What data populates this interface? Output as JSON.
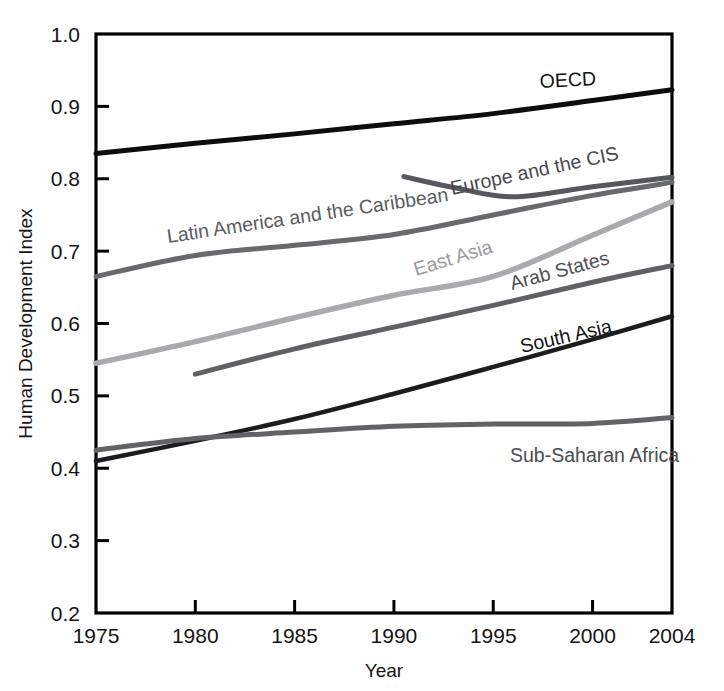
{
  "chart_data": {
    "type": "line",
    "title": "",
    "xlabel": "Year",
    "ylabel": "Human Development Index",
    "xlim": [
      1975,
      2004
    ],
    "ylim": [
      0.2,
      1.0
    ],
    "grid": false,
    "legend_position": "inline-labels",
    "xticks": [
      "1975",
      "1980",
      "1985",
      "1990",
      "1995",
      "2000",
      "2004"
    ],
    "xtick_values": [
      1975,
      1980,
      1985,
      1990,
      1995,
      2000,
      2004
    ],
    "yticks": [
      "0.2",
      "0.3",
      "0.4",
      "0.5",
      "0.6",
      "0.7",
      "0.8",
      "0.9",
      "1.0"
    ],
    "ytick_values": [
      0.2,
      0.3,
      0.4,
      0.5,
      0.6,
      0.7,
      0.8,
      0.9,
      1.0
    ],
    "series": [
      {
        "name": "OECD",
        "color": "#0d0d0d",
        "width": 5.0,
        "label": "OECD",
        "label_x": 540,
        "label_y": 88,
        "label_rotate": -3.0,
        "label_color": "#141414",
        "x": [
          1975,
          1980,
          1985,
          1990,
          1995,
          2000,
          2004
        ],
        "y": [
          0.835,
          0.849,
          0.862,
          0.876,
          0.89,
          0.908,
          0.923
        ]
      },
      {
        "name": "Europe and the CIS",
        "color": "#55585c",
        "width": 5.0,
        "label": "Europe and the CIS",
        "label_x": 452,
        "label_y": 195,
        "label_rotate": -12.0,
        "label_color": "#47494d",
        "x": [
          1990.5,
          1993,
          1996,
          2000,
          2004
        ],
        "y": [
          0.803,
          0.788,
          0.775,
          0.789,
          0.802
        ]
      },
      {
        "name": "Latin America and the Caribbean",
        "color": "#68696d",
        "width": 5.0,
        "label": "Latin America and the Caribbean",
        "label_x": 168,
        "label_y": 243,
        "label_rotate": -8.5,
        "label_color": "#5a5c60",
        "x": [
          1975,
          1980,
          1985,
          1990,
          1995,
          2000,
          2004
        ],
        "y": [
          0.665,
          0.694,
          0.708,
          0.723,
          0.75,
          0.777,
          0.795
        ]
      },
      {
        "name": "East Asia",
        "color": "#a9aaad",
        "width": 5.5,
        "label": "East Asia",
        "label_x": 416,
        "label_y": 276,
        "label_rotate": -17.0,
        "label_color": "#9a9b9e",
        "x": [
          1975,
          1980,
          1985,
          1990,
          1995,
          2000,
          2004
        ],
        "y": [
          0.545,
          0.575,
          0.608,
          0.639,
          0.665,
          0.722,
          0.768
        ]
      },
      {
        "name": "Arab States",
        "color": "#5f6165",
        "width": 5.0,
        "label": "Arab States",
        "label_x": 512,
        "label_y": 290,
        "label_rotate": -15.0,
        "label_color": "#4f5155",
        "x": [
          1980,
          1985,
          1990,
          1995,
          2000,
          2004
        ],
        "y": [
          0.53,
          0.565,
          0.595,
          0.625,
          0.657,
          0.68
        ]
      },
      {
        "name": "South Asia",
        "color": "#1c1c1e",
        "width": 4.5,
        "label": "South Asia",
        "label_x": 522,
        "label_y": 353,
        "label_rotate": -13.0,
        "label_color": "#141414",
        "x": [
          1975,
          1980,
          1985,
          1990,
          1995,
          2000,
          2004
        ],
        "y": [
          0.41,
          0.438,
          0.468,
          0.503,
          0.54,
          0.578,
          0.61
        ]
      },
      {
        "name": "Sub-Saharan Africa",
        "color": "#616367",
        "width": 5.0,
        "label": "Sub-Saharan Africa",
        "label_x": 510,
        "label_y": 462,
        "label_rotate": 0,
        "label_color": "#4a4c50",
        "x": [
          1975,
          1980,
          1985,
          1990,
          1995,
          2000,
          2004
        ],
        "y": [
          0.425,
          0.441,
          0.45,
          0.458,
          0.461,
          0.462,
          0.47
        ]
      }
    ]
  },
  "axes": {
    "x_title": "Year",
    "y_title": "Human Development Index",
    "frame_color": "#000000"
  }
}
